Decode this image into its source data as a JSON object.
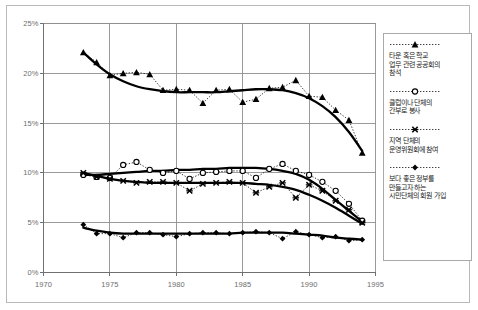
{
  "chart_data": {
    "type": "line",
    "title": "",
    "subtitle": "",
    "xlabel": "",
    "ylabel": "",
    "xlim": [
      1970,
      1995
    ],
    "ylim": [
      0,
      25
    ],
    "xticks": [
      "1970",
      "1975",
      "1980",
      "1985",
      "1990",
      "1995"
    ],
    "xtick_values": [
      1970,
      1975,
      1980,
      1985,
      1990,
      1995
    ],
    "yticks": [
      "0%",
      "5%",
      "10%",
      "15%",
      "20%",
      "25%"
    ],
    "ytick_values": [
      0,
      5,
      10,
      15,
      20,
      25
    ],
    "grid": true,
    "grid_axes": "both",
    "legend_position": "right-outside",
    "marker_line_style": "dotted",
    "trend_line_style": "solid-thick-smoothed",
    "series": [
      {
        "name": "타운 혹은 학교 업무 관련 공공회의 참석",
        "marker": "filled-triangle",
        "color": "#000000",
        "x": [
          1973,
          1974,
          1975,
          1976,
          1977,
          1978,
          1979,
          1980,
          1981,
          1982,
          1983,
          1984,
          1985,
          1986,
          1987,
          1988,
          1989,
          1990,
          1991,
          1992,
          1993,
          1994
        ],
        "values": [
          22.1,
          21.1,
          19.8,
          20.0,
          20.1,
          19.9,
          18.3,
          18.4,
          18.3,
          17.0,
          18.3,
          18.4,
          17.1,
          17.4,
          18.5,
          18.6,
          19.3,
          17.7,
          17.6,
          16.3,
          15.3,
          12.0
        ],
        "trend": [
          22.1,
          20.9,
          19.9,
          19.2,
          18.7,
          18.4,
          18.2,
          18.1,
          18.1,
          18.1,
          18.1,
          18.2,
          18.3,
          18.4,
          18.4,
          18.3,
          18.0,
          17.5,
          16.7,
          15.6,
          14.1,
          12.2
        ]
      },
      {
        "name": "클럽이나 단체의 간부로 봉사",
        "marker": "open-circle",
        "color": "#000000",
        "x": [
          1973,
          1974,
          1975,
          1976,
          1977,
          1978,
          1979,
          1980,
          1981,
          1982,
          1983,
          1984,
          1985,
          1986,
          1987,
          1988,
          1989,
          1990,
          1991,
          1992,
          1993,
          1994
        ],
        "values": [
          9.8,
          9.6,
          9.5,
          10.8,
          11.1,
          10.3,
          10.0,
          10.2,
          9.4,
          10.0,
          10.1,
          10.2,
          10.2,
          9.5,
          10.4,
          10.9,
          10.2,
          9.8,
          9.1,
          8.2,
          6.9,
          5.2
        ],
        "trend": [
          9.8,
          9.8,
          9.9,
          10.0,
          10.1,
          10.2,
          10.2,
          10.3,
          10.3,
          10.4,
          10.4,
          10.5,
          10.5,
          10.5,
          10.4,
          10.2,
          9.9,
          9.3,
          8.4,
          7.3,
          6.2,
          5.1
        ]
      },
      {
        "name": "지역 단체의 운영위원회에 참여",
        "marker": "x-cross",
        "color": "#000000",
        "x": [
          1973,
          1974,
          1975,
          1976,
          1977,
          1978,
          1979,
          1980,
          1981,
          1982,
          1983,
          1984,
          1985,
          1986,
          1987,
          1988,
          1989,
          1990,
          1991,
          1992,
          1993,
          1994
        ],
        "values": [
          10.0,
          9.6,
          9.4,
          9.2,
          9.0,
          9.1,
          9.1,
          9.0,
          8.2,
          8.9,
          9.0,
          9.1,
          9.0,
          8.0,
          8.6,
          9.0,
          7.5,
          8.8,
          8.2,
          7.2,
          6.3,
          5.0
        ],
        "trend": [
          10.0,
          9.7,
          9.4,
          9.2,
          9.1,
          9.0,
          9.0,
          9.0,
          9.0,
          9.0,
          9.0,
          9.0,
          9.0,
          8.9,
          8.8,
          8.6,
          8.3,
          7.8,
          7.2,
          6.5,
          5.7,
          4.9
        ]
      },
      {
        "name": "보다 좋은 정부를 만들고자 하는 시민단체의 회원 가입",
        "marker": "filled-diamond",
        "color": "#000000",
        "x": [
          1973,
          1974,
          1975,
          1976,
          1977,
          1978,
          1979,
          1980,
          1981,
          1982,
          1983,
          1984,
          1985,
          1986,
          1987,
          1988,
          1989,
          1990,
          1991,
          1992,
          1993,
          1994
        ],
        "values": [
          4.8,
          3.9,
          3.9,
          3.5,
          4.0,
          4.0,
          3.8,
          3.6,
          3.9,
          4.0,
          4.0,
          3.9,
          4.0,
          4.1,
          4.0,
          3.4,
          4.1,
          3.8,
          3.5,
          3.6,
          3.2,
          3.3
        ],
        "trend": [
          4.5,
          4.2,
          4.0,
          3.9,
          3.9,
          3.9,
          3.9,
          3.9,
          3.9,
          3.9,
          3.9,
          3.9,
          4.0,
          4.0,
          4.0,
          4.0,
          3.9,
          3.8,
          3.7,
          3.5,
          3.4,
          3.3
        ]
      }
    ]
  },
  "legend": {
    "entries": [
      {
        "label": "타운 혹은 학교\n업무 관련 공공회의\n참석",
        "marker": "filled-triangle"
      },
      {
        "label": "클럽이나 단체의\n간부로 봉사",
        "marker": "open-circle"
      },
      {
        "label": "지역 단체의\n운영위원회에 참여",
        "marker": "x-cross"
      },
      {
        "label": "보다 좋은 정부를\n만들고자 하는\n시민단체의 회원 가입",
        "marker": "filled-diamond"
      }
    ]
  },
  "colors": {
    "ink": "#000000",
    "grid": "#909090",
    "axis_text": "#6e6e6e",
    "frame": "#b9b9b9",
    "background": "#ffffff"
  }
}
